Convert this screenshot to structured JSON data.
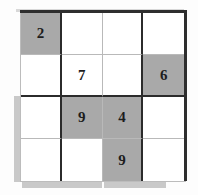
{
  "puzzle": {
    "title": "4x4 Sudoku Grid",
    "size": 4,
    "block_rows": 2,
    "block_cols": 2,
    "colors": {
      "shaded_cell": "#a9a9a9",
      "empty_cell": "#ffffff",
      "thick_line": "#2e2e2e",
      "thin_line": "#b9b9b9",
      "digit": "#1d1d1d",
      "scan_artifact": "#b4b4b4"
    },
    "rows": [
      [
        {
          "value": "2",
          "shaded": true
        },
        {
          "value": "",
          "shaded": false
        },
        {
          "value": "",
          "shaded": false
        },
        {
          "value": "",
          "shaded": false
        }
      ],
      [
        {
          "value": "",
          "shaded": false
        },
        {
          "value": "7",
          "shaded": false
        },
        {
          "value": "",
          "shaded": false
        },
        {
          "value": "6",
          "shaded": true
        }
      ],
      [
        {
          "value": "",
          "shaded": false
        },
        {
          "value": "9",
          "shaded": true
        },
        {
          "value": "4",
          "shaded": true
        },
        {
          "value": "",
          "shaded": false
        }
      ],
      [
        {
          "value": "",
          "shaded": false
        },
        {
          "value": "",
          "shaded": false
        },
        {
          "value": "9",
          "shaded": true
        },
        {
          "value": "",
          "shaded": false
        }
      ]
    ],
    "givens": [
      {
        "row": 1,
        "col": 1,
        "value": "2"
      },
      {
        "row": 2,
        "col": 2,
        "value": "7"
      },
      {
        "row": 2,
        "col": 4,
        "value": "6"
      },
      {
        "row": 3,
        "col": 2,
        "value": "9"
      },
      {
        "row": 3,
        "col": 3,
        "value": "4"
      },
      {
        "row": 4,
        "col": 3,
        "value": "9"
      }
    ]
  }
}
